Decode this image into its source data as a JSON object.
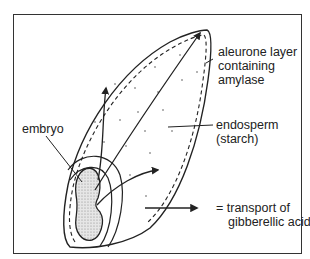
{
  "diagram": {
    "labels": {
      "aleurone": [
        "aleurone layer",
        "containing",
        "amylase"
      ],
      "embryo": "embryo",
      "endosperm": [
        "endosperm",
        "(starch)"
      ],
      "legend": [
        "= transport of",
        "gibberellic acid"
      ]
    },
    "legend": {
      "symbol": "arrow-right",
      "meaning": "transport of gibberellic acid"
    },
    "colors": {
      "line": "#222222",
      "embryo_fill": "#dcdcdc",
      "background": "#ffffff"
    }
  }
}
